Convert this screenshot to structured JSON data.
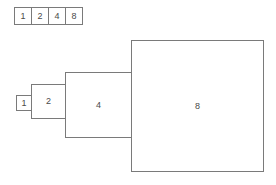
{
  "table": {
    "cells": [
      "1",
      "2",
      "4",
      "8"
    ]
  },
  "squares": [
    {
      "label": "1",
      "value": 1
    },
    {
      "label": "2",
      "value": 2
    },
    {
      "label": "4",
      "value": 4
    },
    {
      "label": "8",
      "value": 8
    }
  ],
  "colors": {
    "border": "#7a7a7a",
    "text": "#4a4a4a",
    "background": "#ffffff"
  }
}
